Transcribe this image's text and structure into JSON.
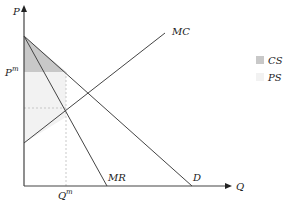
{
  "diagram": {
    "type": "monopoly-welfare",
    "axes": {
      "y_label": "P",
      "x_label": "Q"
    },
    "curves": [
      {
        "name": "MC",
        "label": "MC"
      },
      {
        "name": "MR",
        "label": "MR"
      },
      {
        "name": "D",
        "label": "D"
      }
    ],
    "price_label": {
      "base": "P",
      "sup": "m"
    },
    "quantity_label": {
      "base": "Q",
      "sup": "m"
    },
    "legend": [
      {
        "label": "CS",
        "color": "#c8c8c8"
      },
      {
        "label": "PS",
        "color": "#f2f2f2"
      }
    ],
    "colors": {
      "cs": "#c8c8c8",
      "ps": "#f2f2f2",
      "line": "#444444"
    }
  }
}
